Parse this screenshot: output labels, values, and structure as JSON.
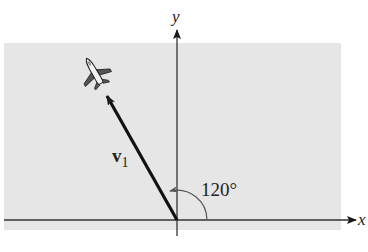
{
  "figure": {
    "axes": {
      "x_label": "x",
      "y_label": "y"
    },
    "vector": {
      "name": "v",
      "subscript": "1",
      "angle_label": "120°",
      "angle_deg": 120
    },
    "colors": {
      "background": "#ffffff",
      "plane_shade": "#e6e6e6",
      "ink": "#1a1a1a",
      "arc": "#555555"
    },
    "icon": "airplane-icon"
  }
}
